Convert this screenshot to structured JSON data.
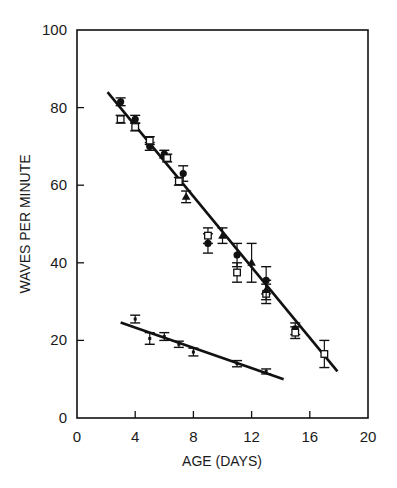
{
  "chart_data": {
    "type": "scatter",
    "title": "",
    "xlabel": "AGE (DAYS)",
    "ylabel": "WAVES PER MINUTE",
    "xlim": [
      0,
      20
    ],
    "ylim": [
      0,
      100
    ],
    "x_ticks": [
      0,
      4,
      8,
      12,
      16,
      20
    ],
    "y_ticks": [
      0,
      20,
      40,
      60,
      80,
      100
    ],
    "x_tick_labels": [
      "0",
      "4",
      "8",
      "12",
      "16",
      "20"
    ],
    "y_tick_labels": [
      "0",
      "20",
      "40",
      "60",
      "80",
      "100"
    ],
    "grid": false,
    "legend": null,
    "series": [
      {
        "name": "upper-filled-circle",
        "marker": "filled-circle",
        "points": [
          {
            "x": 3,
            "y": 81.5,
            "err": 1.0
          },
          {
            "x": 4,
            "y": 77,
            "err": 1.0
          },
          {
            "x": 5,
            "y": 70,
            "err": 1.0
          },
          {
            "x": 6,
            "y": 68,
            "err": 1.0
          },
          {
            "x": 7.3,
            "y": 63,
            "err": 2.0
          },
          {
            "x": 9,
            "y": 45,
            "err": 2.5
          },
          {
            "x": 11,
            "y": 42,
            "err": 3.0
          },
          {
            "x": 13,
            "y": 35.5,
            "err": 3.5
          },
          {
            "x": 15,
            "y": 23,
            "err": 1.5
          }
        ]
      },
      {
        "name": "upper-open-square",
        "marker": "open-square",
        "points": [
          {
            "x": 3,
            "y": 77,
            "err": 1.0
          },
          {
            "x": 4,
            "y": 75,
            "err": 1.0
          },
          {
            "x": 5,
            "y": 71.5,
            "err": 1.0
          },
          {
            "x": 6.2,
            "y": 67,
            "err": 1.0
          },
          {
            "x": 7,
            "y": 61,
            "err": 1.0
          },
          {
            "x": 9,
            "y": 47,
            "err": 2.0
          },
          {
            "x": 11,
            "y": 37.5,
            "err": 2.5
          },
          {
            "x": 13,
            "y": 32,
            "err": 2.5
          },
          {
            "x": 15,
            "y": 22,
            "err": 1.5
          },
          {
            "x": 17,
            "y": 16.5,
            "err": 3.5
          }
        ]
      },
      {
        "name": "upper-filled-triangle",
        "marker": "filled-triangle",
        "points": [
          {
            "x": 7.5,
            "y": 57,
            "err": 1.5
          },
          {
            "x": 10,
            "y": 47,
            "err": 2.0
          },
          {
            "x": 12,
            "y": 40,
            "err": 5.0
          },
          {
            "x": 13,
            "y": 33,
            "err": 2.5
          }
        ]
      },
      {
        "name": "lower-series",
        "marker": "error-bar-only",
        "points": [
          {
            "x": 4,
            "y": 25.5,
            "err": 1.0
          },
          {
            "x": 5,
            "y": 20.5,
            "err": 1.5
          },
          {
            "x": 6,
            "y": 21,
            "err": 1.0
          },
          {
            "x": 7,
            "y": 19,
            "err": 0.8
          },
          {
            "x": 8,
            "y": 17,
            "err": 1.0
          },
          {
            "x": 11,
            "y": 14,
            "err": 0.8
          },
          {
            "x": 13,
            "y": 12,
            "err": 0.6
          }
        ]
      }
    ],
    "fit_lines": [
      {
        "name": "upper-regression",
        "x": [
          2.1,
          17.9
        ],
        "y": [
          84,
          12
        ]
      },
      {
        "name": "lower-regression",
        "x": [
          3.0,
          14.2
        ],
        "y": [
          24.6,
          10
        ]
      }
    ]
  },
  "layout": {
    "plot_left": 77,
    "plot_right": 368,
    "plot_top": 30,
    "plot_bottom": 418,
    "ink_color": "#111111"
  }
}
